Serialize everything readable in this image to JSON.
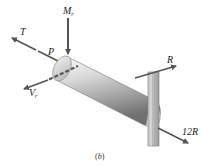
{
  "figure": {
    "caption": "(b)",
    "caption_parts": {
      "open": "(",
      "letter": "b",
      "close": ")"
    },
    "colors": {
      "arrow": "#555555",
      "cylinder_light": "#e6e6e6",
      "cylinder_dark": "#8c8c8c",
      "plate": "#bdbdbd",
      "label": "#222222"
    }
  },
  "labels": {
    "T": "T",
    "P": "P",
    "Mr_main": "M",
    "Mr_sub": "r",
    "Vr_main": "V",
    "Vr_sub": "r",
    "R": "R",
    "R12": "12R"
  },
  "forces": [
    {
      "name": "T",
      "direction": "up-left along shaft axis"
    },
    {
      "name": "P",
      "direction": "up-left along shaft axis"
    },
    {
      "name": "Mr",
      "direction": "down (vertical)"
    },
    {
      "name": "Vr",
      "direction": "left (transverse)"
    },
    {
      "name": "R",
      "direction": "right, at top of plate"
    },
    {
      "name": "12R",
      "direction": "down-right, at end of shaft"
    }
  ]
}
